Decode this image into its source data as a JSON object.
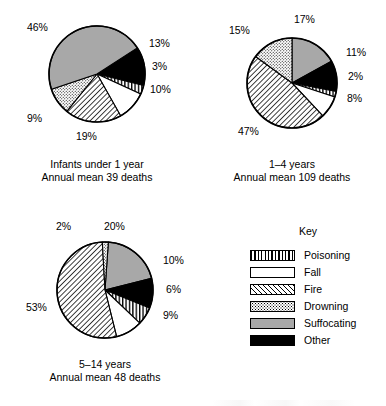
{
  "key": {
    "title": "Key",
    "entries": [
      {
        "label": "Poisoning",
        "pattern": "vertical-stripes",
        "swatch_class": "sw-poisoning",
        "color": "#000000"
      },
      {
        "label": "Fall",
        "pattern": "blank-white",
        "swatch_class": "sw-fall",
        "color": "#ffffff"
      },
      {
        "label": "Fire",
        "pattern": "diagonal-hatch",
        "swatch_class": "sw-fire",
        "color": "#ffffff"
      },
      {
        "label": "Drowning",
        "pattern": "stipple-dots",
        "swatch_class": "sw-drowning",
        "color": "#ffffff"
      },
      {
        "label": "Suffocating",
        "pattern": "solid-gray",
        "swatch_class": "sw-suffocating",
        "color": "#a8a8a8"
      },
      {
        "label": "Other",
        "pattern": "solid-black",
        "swatch_class": "sw-other",
        "color": "#000000"
      }
    ]
  },
  "chart_data": [
    {
      "type": "pie",
      "id": "infants-under-1-year",
      "title": "Infants under 1 year",
      "subtitle": "Annual mean 39 deaths",
      "annual_mean_deaths": 39,
      "categories": [
        "Other",
        "Poisoning",
        "Fall",
        "Fire",
        "Drowning",
        "Suffocating"
      ],
      "values": [
        13,
        3,
        10,
        19,
        9,
        46
      ],
      "value_labels": [
        "13%",
        "3%",
        "10%",
        "19%",
        "9%",
        "46%"
      ],
      "units": "percent",
      "legend_position": "external-key"
    },
    {
      "type": "pie",
      "id": "1-4-years",
      "title": "1–4 years",
      "subtitle": "Annual mean 109 deaths",
      "annual_mean_deaths": 109,
      "categories": [
        "Suffocating",
        "Other",
        "Poisoning",
        "Fall",
        "Fire",
        "Drowning"
      ],
      "values": [
        17,
        11,
        2,
        8,
        47,
        15
      ],
      "value_labels": [
        "17%",
        "11%",
        "2%",
        "8%",
        "47%",
        "15%"
      ],
      "units": "percent",
      "legend_position": "external-key"
    },
    {
      "type": "pie",
      "id": "5-14-years",
      "title": "5–14 years",
      "subtitle": "Annual mean 48 deaths",
      "annual_mean_deaths": 48,
      "categories": [
        "Suffocating",
        "Other",
        "Poisoning",
        "Fall",
        "Fire",
        "Drowning"
      ],
      "values": [
        20,
        10,
        6,
        9,
        53,
        2
      ],
      "value_labels": [
        "20%",
        "10%",
        "6%",
        "9%",
        "53%",
        "2%"
      ],
      "units": "percent",
      "legend_position": "external-key"
    }
  ],
  "pies": [
    {
      "cx": 97,
      "cy": 74,
      "r": 48,
      "start_angle": -33,
      "slices": [
        {
          "cat": "Other",
          "value": 13,
          "label": "13%",
          "lx": 149,
          "ly": 38
        },
        {
          "cat": "Poisoning",
          "value": 3,
          "label": "3%",
          "lx": 152,
          "ly": 61
        },
        {
          "cat": "Fall",
          "value": 10,
          "label": "10%",
          "lx": 150,
          "ly": 84
        },
        {
          "cat": "Fire",
          "value": 19,
          "label": "19%",
          "lx": 76,
          "ly": 131
        },
        {
          "cat": "Drowning",
          "value": 9,
          "label": "9%",
          "lx": 27,
          "ly": 113
        },
        {
          "cat": "Suffocating",
          "value": 46,
          "label": "46%",
          "lx": 27,
          "ly": 22
        }
      ]
    },
    {
      "cx": 292,
      "cy": 83,
      "r": 45,
      "start_angle": -90,
      "slices": [
        {
          "cat": "Suffocating",
          "value": 17,
          "label": "17%",
          "lx": 294,
          "ly": 14
        },
        {
          "cat": "Other",
          "value": 11,
          "label": "11%",
          "lx": 346,
          "ly": 47
        },
        {
          "cat": "Poisoning",
          "value": 2,
          "label": "2%",
          "lx": 348,
          "ly": 71
        },
        {
          "cat": "Fall",
          "value": 8,
          "label": "8%",
          "lx": 347,
          "ly": 93
        },
        {
          "cat": "Fire",
          "value": 47,
          "label": "47%",
          "lx": 238,
          "ly": 126
        },
        {
          "cat": "Drowning",
          "value": 15,
          "label": "15%",
          "lx": 229,
          "ly": 25
        }
      ]
    },
    {
      "cx": 105,
      "cy": 290,
      "r": 48,
      "start_angle": -86,
      "slices": [
        {
          "cat": "Suffocating",
          "value": 20,
          "label": "20%",
          "lx": 104,
          "ly": 221
        },
        {
          "cat": "Other",
          "value": 10,
          "label": "10%",
          "lx": 163,
          "ly": 255
        },
        {
          "cat": "Poisoning",
          "value": 6,
          "label": "6%",
          "lx": 166,
          "ly": 284
        },
        {
          "cat": "Fall",
          "value": 9,
          "label": "9%",
          "lx": 163,
          "ly": 310
        },
        {
          "cat": "Fire",
          "value": 53,
          "label": "53%",
          "lx": 26,
          "ly": 302
        },
        {
          "cat": "Drowning",
          "value": 2,
          "label": "2%",
          "lx": 56,
          "ly": 221
        }
      ]
    }
  ],
  "captions": [
    {
      "line1": "Infants under 1 year",
      "line2": "Annual mean 39 deaths",
      "left": 22,
      "top": 158,
      "width": 150
    },
    {
      "line1": "1–4 years",
      "line2": "Annual mean 109 deaths",
      "left": 217,
      "top": 158,
      "width": 150
    },
    {
      "line1": "5–14 years",
      "line2": "Annual mean 48 deaths",
      "left": 30,
      "top": 358,
      "width": 150
    }
  ]
}
